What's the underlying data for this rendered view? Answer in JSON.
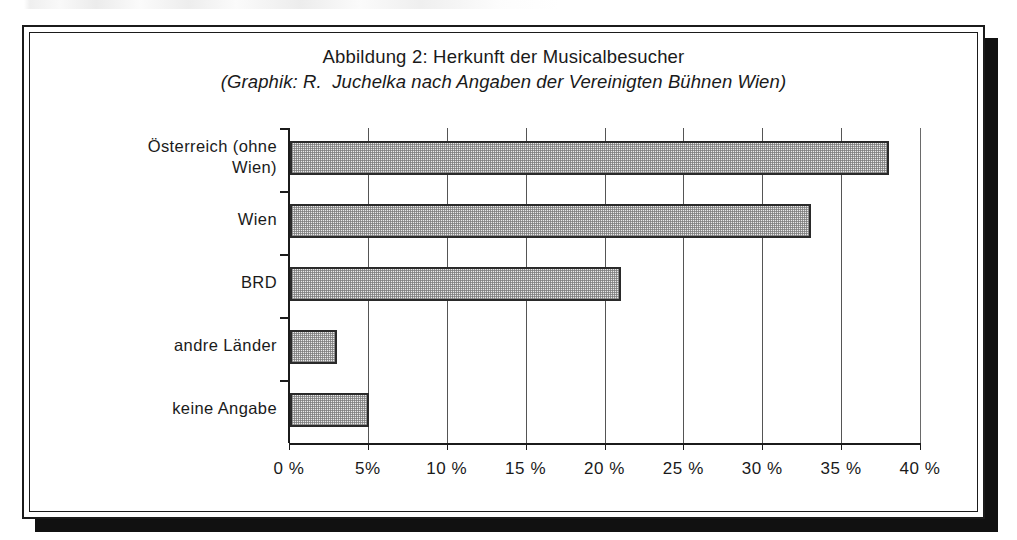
{
  "figure": {
    "title": "Abbildung 2: Herkunft der Musicalbesucher",
    "subtitle": "(Graphik: R.  Juchelka nach Angaben der Vereinigten Bühnen Wien)"
  },
  "chart_data": {
    "type": "bar",
    "orientation": "horizontal",
    "title": "Abbildung 2: Herkunft der Musicalbesucher",
    "subtitle": "(Graphik: R.  Juchelka nach Angaben der Vereinigten Bühnen Wien)",
    "categories": [
      "Österreich (ohne\nWien)",
      "Wien",
      "BRD",
      "andre Länder",
      "keine Angabe"
    ],
    "values": [
      38,
      33,
      21,
      3,
      5
    ],
    "xlabel": "",
    "ylabel": "",
    "xlim": [
      0,
      40
    ],
    "xtick_values": [
      0,
      5,
      10,
      15,
      20,
      25,
      30,
      35,
      40
    ],
    "xtick_labels": [
      "0 %",
      "5%",
      "10 %",
      "15 %",
      "20 %",
      "25 %",
      "30 %",
      "35 %",
      "40 %"
    ],
    "grid": "vertical",
    "legend": "none",
    "bar_fill_color": "#e9e9e9",
    "bar_edge_color": "#2a2a2a",
    "axis_color": "#1b1b1b"
  }
}
